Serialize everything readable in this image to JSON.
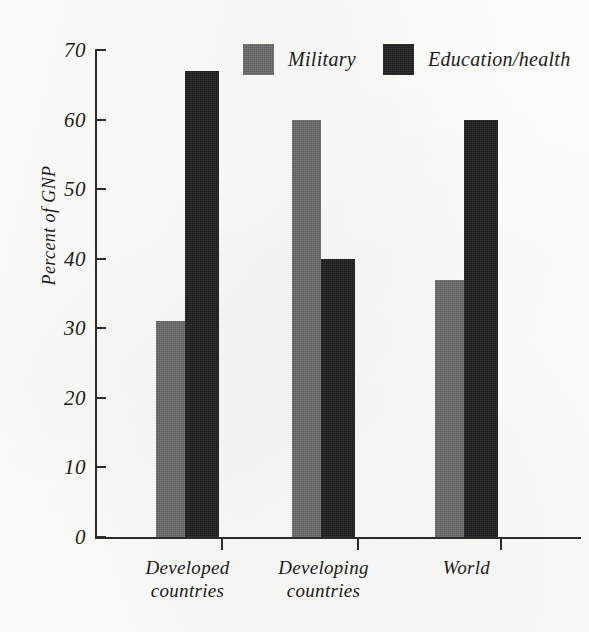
{
  "chart_data": {
    "type": "bar",
    "title": "",
    "subtitle": "",
    "xlabel": "",
    "ylabel": "Percent of GNP",
    "ylim": [
      0,
      70
    ],
    "ytick_step": 10,
    "yticks": [
      "70",
      "60",
      "50",
      "40",
      "30",
      "20",
      "10",
      "0"
    ],
    "grid": false,
    "legend_position": "top-center",
    "categories": [
      "Developed countries",
      "Developing countries",
      "World"
    ],
    "category_lines": [
      [
        "Developed",
        "countries"
      ],
      [
        "Developing",
        "countries"
      ],
      [
        "World",
        ""
      ]
    ],
    "series": [
      {
        "name": "Military",
        "color": "#6a6a6a",
        "values": [
          31,
          60,
          37
        ]
      },
      {
        "name": "Education/health",
        "color": "#1f1f1f",
        "values": [
          67,
          40,
          60
        ]
      }
    ]
  },
  "legend": {
    "items": [
      {
        "label": "Military",
        "swatch": "gray-swatch"
      },
      {
        "label": "Education/health",
        "swatch": "dark-swatch"
      }
    ]
  },
  "axes": {
    "y_title": "Percent of GNP",
    "y_tick_labels": [
      "70",
      "60",
      "50",
      "40",
      "30",
      "20",
      "10",
      "0"
    ]
  }
}
